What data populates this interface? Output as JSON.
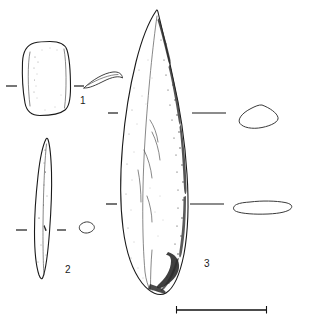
{
  "plate": {
    "kind": "archaeological-artifact-plate",
    "background_color": "#ffffff",
    "ink_color": "#1a1a1a",
    "width": 309,
    "height": 334
  },
  "artifacts": [
    {
      "id": "artifact-1",
      "number": "1",
      "label_x": 80,
      "label_y": 96,
      "description": "rounded-rectangular object, stippled interior",
      "section": "thin curved crescent profile"
    },
    {
      "id": "artifact-2",
      "number": "2",
      "label_x": 65,
      "label_y": 265,
      "description": "narrow elongated pointed blade",
      "section": "small lozenge"
    },
    {
      "id": "artifact-3",
      "number": "3",
      "label_x": 204,
      "label_y": 259,
      "description": "large leaf-shaped point with heavy shading on right edge",
      "section_upper": "lozenge",
      "section_lower": "flattened lenticular"
    }
  ],
  "scale_bar": {
    "name": "scale-bar",
    "x_start": 176,
    "x_end": 267,
    "y": 310
  }
}
